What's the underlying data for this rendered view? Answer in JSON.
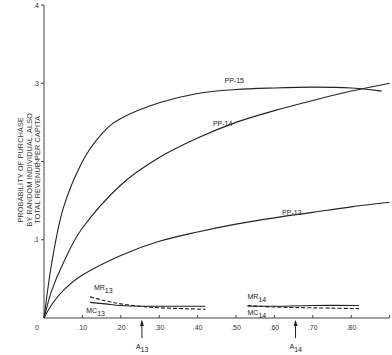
{
  "chart_data": {
    "type": "line",
    "title": "",
    "xlabel": "",
    "ylabel": [
      "PROBABILITY OF PURCHASE",
      "BY RANDOM INDIVIDUAL, ALSO",
      "TOTAL REVENUE PER CAPITA"
    ],
    "xlim": [
      0,
      0.9
    ],
    "ylim": [
      0,
      0.4
    ],
    "grid": false,
    "legend": "none (inline curve labels)",
    "x_ticks": [
      "0",
      ".10",
      ".20",
      ".30",
      ".40",
      ".50",
      ".60",
      ".70",
      ".80"
    ],
    "x_tick_values": [
      0,
      0.1,
      0.2,
      0.3,
      0.4,
      0.5,
      0.6,
      0.7,
      0.8,
      0.9
    ],
    "y_ticks": [
      ".1",
      ".2",
      ".3",
      ".4"
    ],
    "y_tick_values": [
      0.1,
      0.2,
      0.3,
      0.4
    ],
    "series": [
      {
        "name": "PP-15",
        "style": "solid",
        "x": [
          0,
          0.02,
          0.05,
          0.1,
          0.15,
          0.2,
          0.3,
          0.4,
          0.5,
          0.6,
          0.7,
          0.8,
          0.88
        ],
        "y": [
          0,
          0.07,
          0.14,
          0.2,
          0.235,
          0.255,
          0.275,
          0.287,
          0.292,
          0.294,
          0.295,
          0.294,
          0.29
        ],
        "label_at": [
          0.47,
          0.3
        ]
      },
      {
        "name": "PP-14",
        "style": "solid",
        "x": [
          0,
          0.02,
          0.05,
          0.1,
          0.2,
          0.3,
          0.4,
          0.5,
          0.6,
          0.7,
          0.8,
          0.9
        ],
        "y": [
          0,
          0.035,
          0.07,
          0.115,
          0.17,
          0.205,
          0.23,
          0.25,
          0.265,
          0.278,
          0.29,
          0.3
        ],
        "label_at": [
          0.44,
          0.245
        ]
      },
      {
        "name": "PP-13",
        "style": "solid",
        "x": [
          0,
          0.02,
          0.05,
          0.1,
          0.2,
          0.3,
          0.4,
          0.5,
          0.6,
          0.7,
          0.8,
          0.9
        ],
        "y": [
          0,
          0.017,
          0.035,
          0.055,
          0.08,
          0.098,
          0.11,
          0.12,
          0.128,
          0.135,
          0.142,
          0.148
        ],
        "label_at": [
          0.62,
          0.132
        ]
      },
      {
        "name": "MR13",
        "style": "dashed",
        "x": [
          0.12,
          0.16,
          0.2,
          0.25,
          0.3,
          0.36,
          0.42
        ],
        "y": [
          0.027,
          0.022,
          0.018,
          0.015,
          0.013,
          0.012,
          0.011
        ],
        "label_at": [
          0.13,
          0.036
        ]
      },
      {
        "name": "MC13",
        "style": "solid",
        "x": [
          0.12,
          0.16,
          0.2,
          0.25,
          0.3,
          0.36,
          0.42
        ],
        "y": [
          0.02,
          0.018,
          0.016,
          0.015,
          0.015,
          0.015,
          0.015
        ],
        "label_at": [
          0.11,
          0.006
        ]
      },
      {
        "name": "MR14",
        "style": "dashed",
        "x": [
          0.53,
          0.6,
          0.7,
          0.82
        ],
        "y": [
          0.016,
          0.014,
          0.013,
          0.012
        ],
        "label_at": [
          0.53,
          0.024
        ]
      },
      {
        "name": "MC14",
        "style": "solid",
        "x": [
          0.53,
          0.6,
          0.7,
          0.82
        ],
        "y": [
          0.015,
          0.015,
          0.016,
          0.016
        ],
        "label_at": [
          0.53,
          0.004
        ]
      }
    ],
    "annotations": [
      {
        "text": "A",
        "subscript": "13",
        "x": 0.255,
        "type": "arrow-up-to-axis"
      },
      {
        "text": "A",
        "subscript": "14",
        "x": 0.655,
        "type": "arrow-up-to-axis"
      }
    ]
  }
}
